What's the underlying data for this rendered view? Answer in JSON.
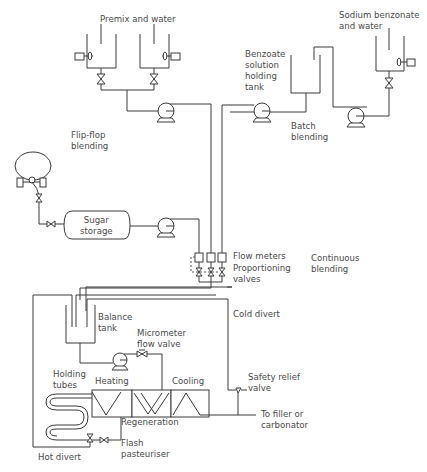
{
  "diagram": {
    "title": "",
    "sections": {
      "flip_flop": "Flip-flop\nblending",
      "batch": "Batch\nblending",
      "continuous": "Continuous\nblending"
    },
    "labels": {
      "premix": "Premix and water",
      "sodium_benzonate": "Sodium benzonate\nand water",
      "benzoate_holding": "Benzoate\nsolution\nholding\ntank",
      "sugar_storage": "Sugar\nstorage",
      "flow_meters": "Flow meters",
      "proportioning_valves": "Proportioning\nvalves",
      "cold_divert": "Cold divert",
      "balance_tank": "Balance\ntank",
      "micrometer_valve": "Micrometer\nflow valve",
      "holding_tubes": "Holding\ntubes",
      "heating": "Heating",
      "cooling": "Cooling",
      "regeneration": "Regeneration",
      "safety_relief": "Safety relief\nvalve",
      "to_filler": "To filler or\ncarbonator",
      "flash_pasteuriser": "Flash\npasteuriser",
      "hot_divert": "Hot divert"
    },
    "colors": {
      "line": "#3a3a3a",
      "text": "#4a4a4a",
      "background": "#ffffff"
    }
  }
}
